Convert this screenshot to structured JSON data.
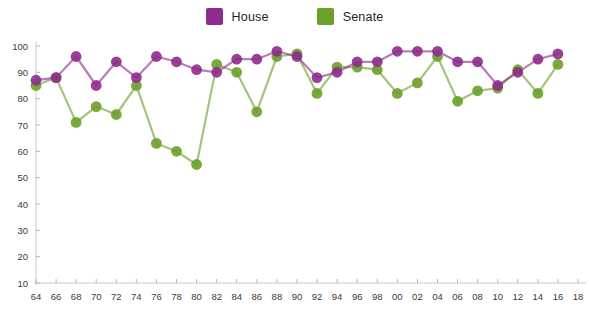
{
  "legend": {
    "position": "top-center",
    "items": [
      {
        "label": "House",
        "color": "#8e2b8c",
        "icon": "square-swatch"
      },
      {
        "label": "Senate",
        "color": "#6ba02a",
        "icon": "square-swatch"
      }
    ]
  },
  "chart_data": {
    "type": "line",
    "title": "",
    "subtitle": "",
    "xlabel": "",
    "ylabel": "",
    "grid": false,
    "xlim": [
      64,
      18
    ],
    "ylim": [
      0,
      100
    ],
    "y_ticks": [
      10,
      20,
      30,
      40,
      50,
      60,
      70,
      80,
      90,
      100
    ],
    "y_tick_labels": [
      "10",
      "20",
      "30",
      "40",
      "50",
      "60",
      "70",
      "80",
      "90",
      "100"
    ],
    "categories": [
      "64",
      "66",
      "68",
      "70",
      "72",
      "74",
      "76",
      "78",
      "80",
      "82",
      "84",
      "86",
      "88",
      "90",
      "92",
      "94",
      "96",
      "98",
      "00",
      "02",
      "04",
      "06",
      "08",
      "10",
      "12",
      "14",
      "16",
      "18"
    ],
    "x_tick_labels": [
      "64",
      "66",
      "68",
      "70",
      "72",
      "74",
      "76",
      "78",
      "80",
      "82",
      "84",
      "86",
      "88",
      "90",
      "92",
      "94",
      "96",
      "98",
      "00",
      "02",
      "04",
      "06",
      "08",
      "10",
      "12",
      "14",
      "16",
      "18"
    ],
    "series": [
      {
        "name": "House",
        "color": "#8e2b8c",
        "values": [
          87,
          88,
          96,
          85,
          94,
          88,
          96,
          94,
          91,
          90,
          95,
          95,
          98,
          96,
          88,
          90,
          94,
          94,
          98,
          98,
          98,
          94,
          94,
          85,
          90,
          95,
          97,
          null
        ]
      },
      {
        "name": "Senate",
        "color": "#6ba02a",
        "values": [
          85,
          88,
          71,
          77,
          74,
          85,
          63,
          60,
          55,
          93,
          90,
          75,
          96,
          97,
          82,
          92,
          92,
          91,
          82,
          86,
          96,
          79,
          83,
          84,
          91,
          82,
          93,
          null
        ]
      }
    ]
  }
}
